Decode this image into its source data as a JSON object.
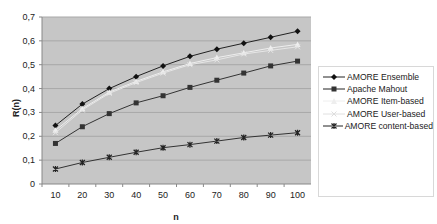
{
  "chart_data": {
    "type": "line",
    "title": "",
    "xlabel": "n",
    "ylabel": "R(n)",
    "x": [
      10,
      20,
      30,
      40,
      50,
      60,
      70,
      80,
      90,
      100
    ],
    "xticks": [
      "10",
      "20",
      "30",
      "40",
      "50",
      "60",
      "70",
      "80",
      "90",
      "100"
    ],
    "yticks": [
      "0",
      "0,1",
      "0,2",
      "0,3",
      "0,4",
      "0,5",
      "0,6",
      "0,7"
    ],
    "ylim": [
      0,
      0.7
    ],
    "grid": true,
    "legend_position": "right",
    "series": [
      {
        "name": "AMORE Ensemble",
        "marker": "diamond",
        "color": "#222222",
        "values": [
          0.245,
          0.335,
          0.4,
          0.45,
          0.495,
          0.535,
          0.565,
          0.59,
          0.615,
          0.64
        ]
      },
      {
        "name": "Apache Mahout",
        "marker": "square",
        "color": "#333333",
        "values": [
          0.17,
          0.24,
          0.295,
          0.34,
          0.37,
          0.405,
          0.435,
          0.465,
          0.495,
          0.515
        ]
      },
      {
        "name": "AMORE Item-based",
        "marker": "triangle",
        "color": "#eeeeee",
        "values": [
          0.225,
          0.315,
          0.385,
          0.43,
          0.47,
          0.505,
          0.53,
          0.55,
          0.57,
          0.585
        ]
      },
      {
        "name": "AMORE User-based",
        "marker": "x",
        "color": "#e6e6e6",
        "values": [
          0.215,
          0.31,
          0.38,
          0.425,
          0.465,
          0.5,
          0.52,
          0.545,
          0.56,
          0.575
        ]
      },
      {
        "name": "AMORE content-based",
        "marker": "star",
        "color": "#333333",
        "values": [
          0.063,
          0.09,
          0.112,
          0.133,
          0.152,
          0.165,
          0.18,
          0.195,
          0.205,
          0.215
        ]
      }
    ]
  },
  "legend": {
    "items": [
      "AMORE Ensemble",
      "Apache Mahout",
      "AMORE Item-based",
      "AMORE User-based",
      "AMORE content-based"
    ]
  }
}
